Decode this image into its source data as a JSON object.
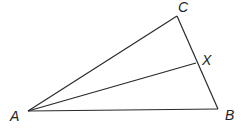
{
  "diagram": {
    "type": "triangle",
    "points": {
      "A": {
        "label": "A",
        "x": 28,
        "y": 111
      },
      "B": {
        "label": "B",
        "x": 218,
        "y": 109
      },
      "C": {
        "label": "C",
        "x": 177,
        "y": 16
      },
      "X": {
        "label": "X",
        "x": 196,
        "y": 63
      }
    },
    "segments": [
      [
        "A",
        "B"
      ],
      [
        "B",
        "C"
      ],
      [
        "C",
        "A"
      ],
      [
        "A",
        "X"
      ]
    ],
    "labels": {
      "A": "A",
      "B": "B",
      "C": "C",
      "X": "X"
    }
  }
}
